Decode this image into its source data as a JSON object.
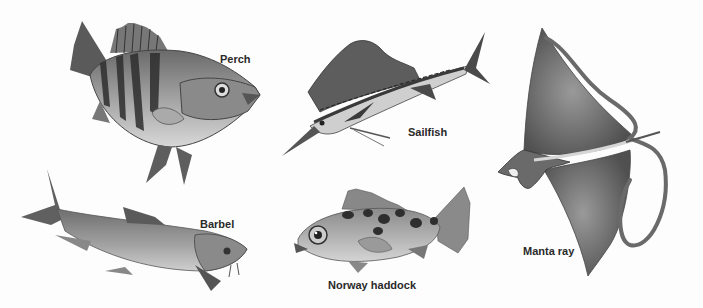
{
  "illustration": {
    "style": "grayscale",
    "background_color": "#fdfdfd",
    "ink_color": "#2a2a2a",
    "specimens": [
      {
        "id": "perch",
        "label": "Perch"
      },
      {
        "id": "sailfish",
        "label": "Sailfish"
      },
      {
        "id": "manta-ray",
        "label": "Manta ray"
      },
      {
        "id": "barbel",
        "label": "Barbel"
      },
      {
        "id": "norway-haddock",
        "label": "Norway haddock"
      }
    ]
  }
}
